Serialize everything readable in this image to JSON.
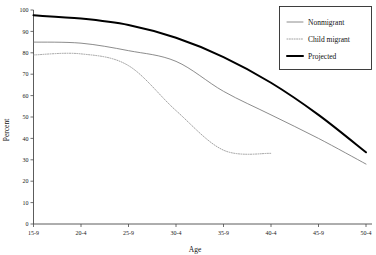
{
  "chart_data": {
    "type": "line",
    "title": "",
    "xlabel": "Age",
    "ylabel": "Percent",
    "categories": [
      "15-9",
      "20-4",
      "25-9",
      "30-4",
      "35-9",
      "40-4",
      "45-9",
      "50-4"
    ],
    "ylim": [
      0,
      100
    ],
    "yticks": [
      0,
      10,
      20,
      30,
      40,
      50,
      60,
      70,
      80,
      90,
      100
    ],
    "grid": false,
    "legend_position": "top-right",
    "series": [
      {
        "name": "Nonmigrant",
        "style": "solid-thin",
        "color": "#6e6e6e",
        "values": [
          85,
          84.5,
          81,
          76,
          62,
          51,
          40,
          28
        ]
      },
      {
        "name": "Child migrant",
        "style": "dotted",
        "color": "#8a8a8a",
        "values": [
          79,
          79.5,
          74,
          53,
          34.5,
          33,
          null,
          null
        ]
      },
      {
        "name": "Projected",
        "style": "solid-thick",
        "color": "#000000",
        "values": [
          97.5,
          96,
          93,
          87,
          78,
          66,
          51,
          33.5
        ]
      }
    ]
  },
  "legend": {
    "entries": [
      {
        "label": "Nonmigrant"
      },
      {
        "label": "Child migrant"
      },
      {
        "label": "Projected"
      }
    ]
  },
  "axes": {
    "y_title": "Percent",
    "x_title": "Age",
    "y_tick_labels": [
      "100",
      "90",
      "80",
      "70",
      "60",
      "50",
      "40",
      "30",
      "20",
      "10",
      "0"
    ],
    "x_tick_labels": [
      "15-9",
      "20-4",
      "25-9",
      "30-4",
      "35-9",
      "40-4",
      "45-9",
      "50-4"
    ]
  }
}
